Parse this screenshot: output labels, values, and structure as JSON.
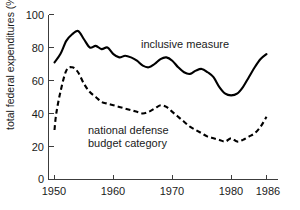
{
  "chart_data": {
    "type": "line",
    "title": "",
    "subtitle": "",
    "xlabel": "",
    "ylabel": "total federal expenditures (%)",
    "xlim": [
      1949,
      1987
    ],
    "ylim": [
      0,
      100
    ],
    "grid": false,
    "legend_position": "inline-annotation",
    "xticks": [
      1950,
      1960,
      1970,
      1980,
      1986
    ],
    "xtick_labels": [
      "1950",
      "1960",
      "1970",
      "1980",
      "1986"
    ],
    "yticks": [
      0,
      20,
      40,
      60,
      80,
      100
    ],
    "ytick_labels": [
      "0",
      "20",
      "40",
      "60",
      "80",
      "100"
    ],
    "annotations": [
      {
        "text": "inclusive measure",
        "x": 1966,
        "y": 82
      },
      {
        "text": "national defense",
        "x": 1958,
        "y": 35
      },
      {
        "text": "budget category",
        "x": 1958,
        "y": 29
      }
    ],
    "series": [
      {
        "name": "inclusive measure",
        "style": "solid",
        "x": [
          1950,
          1951,
          1952,
          1953,
          1954,
          1955,
          1956,
          1957,
          1958,
          1959,
          1960,
          1961,
          1962,
          1963,
          1964,
          1965,
          1966,
          1967,
          1968,
          1969,
          1970,
          1971,
          1972,
          1973,
          1974,
          1975,
          1976,
          1977,
          1978,
          1979,
          1980,
          1981,
          1982,
          1983,
          1984,
          1985,
          1986
        ],
        "values": [
          71,
          76,
          84,
          88,
          90,
          85,
          80,
          81,
          79,
          80,
          76,
          74,
          75,
          74,
          72,
          69,
          68,
          70,
          73,
          74,
          72,
          68,
          65,
          64,
          66,
          67,
          65,
          62,
          56,
          52,
          51,
          52,
          56,
          62,
          68,
          73,
          76
        ]
      },
      {
        "name": "national defense budget category",
        "style": "dashed",
        "x": [
          1950,
          1950.3,
          1951,
          1952,
          1953,
          1954,
          1955,
          1956,
          1957,
          1958,
          1959,
          1960,
          1961,
          1962,
          1963,
          1964,
          1965,
          1966,
          1967,
          1968,
          1969,
          1970,
          1971,
          1972,
          1973,
          1974,
          1975,
          1976,
          1977,
          1978,
          1979,
          1980,
          1981,
          1982,
          1983,
          1984,
          1985,
          1986
        ],
        "values": [
          30,
          40,
          53,
          66,
          68,
          65,
          58,
          53,
          50,
          47,
          46,
          45,
          44,
          43,
          42,
          41,
          40,
          41,
          43,
          45,
          44,
          41,
          38,
          35,
          32,
          30,
          28,
          26,
          25,
          24,
          23,
          25,
          23,
          24,
          26,
          28,
          32,
          38
        ]
      }
    ]
  },
  "axes": {
    "y_axis_title": "total federal expenditures (%)"
  }
}
